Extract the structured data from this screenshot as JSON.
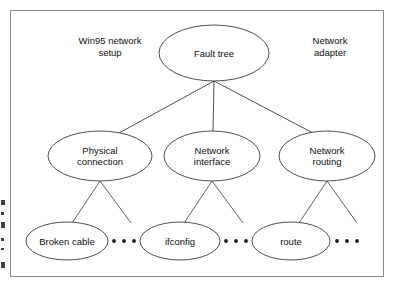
{
  "figure": {
    "kind": "fault-tree-diagram",
    "background_color": "#ffffff",
    "frame_color": "#8a8a8a",
    "stroke_color": "#3a3a3a",
    "text_color": "#101010"
  },
  "annotations": [
    {
      "id": "left-annotation",
      "text": "Win95 network\nsetup",
      "x": 110,
      "y": 46
    },
    {
      "id": "right-annotation",
      "text": "Network\nadapter",
      "x": 330,
      "y": 46
    }
  ],
  "nodes": [
    {
      "id": "fault-tree",
      "label": "Fault tree",
      "level": 0,
      "cx": 214,
      "cy": 53,
      "rx": 55,
      "ry": 28
    },
    {
      "id": "physical-connection",
      "label": "Physical\nconnection",
      "level": 1,
      "cx": 100,
      "cy": 156,
      "rx": 52,
      "ry": 25
    },
    {
      "id": "network-interface",
      "label": "Network\ninterface",
      "level": 1,
      "cx": 212,
      "cy": 156,
      "rx": 48,
      "ry": 25
    },
    {
      "id": "network-routing",
      "label": "Network\nrouting",
      "level": 1,
      "cx": 327,
      "cy": 156,
      "rx": 48,
      "ry": 25
    },
    {
      "id": "broken-cable",
      "label": "Broken cable",
      "level": 2,
      "cx": 67,
      "cy": 241,
      "rx": 41,
      "ry": 19
    },
    {
      "id": "ifconfig",
      "label": "ifconfig",
      "level": 2,
      "cx": 180,
      "cy": 241,
      "rx": 40,
      "ry": 19
    },
    {
      "id": "route",
      "label": "route",
      "level": 2,
      "cx": 291,
      "cy": 241,
      "rx": 39,
      "ry": 19
    }
  ],
  "edges": [
    {
      "id": "edge-root-physical",
      "from": "fault-tree",
      "to": "physical-connection",
      "x1": 214,
      "y1": 81,
      "x2": 119,
      "y2": 133
    },
    {
      "id": "edge-root-interface",
      "from": "fault-tree",
      "to": "network-interface",
      "x1": 214,
      "y1": 81,
      "x2": 213,
      "y2": 131
    },
    {
      "id": "edge-root-routing",
      "from": "fault-tree",
      "to": "network-routing",
      "x1": 214,
      "y1": 81,
      "x2": 313,
      "y2": 133
    },
    {
      "id": "edge-physical-broken",
      "from": "physical-connection",
      "to": "broken-cable",
      "x1": 100,
      "y1": 181,
      "x2": 72,
      "y2": 223
    },
    {
      "id": "edge-physical-more",
      "from": "physical-connection",
      "to": "more-1",
      "x1": 100,
      "y1": 181,
      "x2": 131,
      "y2": 223
    },
    {
      "id": "edge-interface-ifconfig",
      "from": "network-interface",
      "to": "ifconfig",
      "x1": 212,
      "y1": 181,
      "x2": 184,
      "y2": 223
    },
    {
      "id": "edge-interface-more",
      "from": "network-interface",
      "to": "more-2",
      "x1": 212,
      "y1": 181,
      "x2": 243,
      "y2": 223
    },
    {
      "id": "edge-routing-route",
      "from": "network-routing",
      "to": "route",
      "x1": 327,
      "y1": 181,
      "x2": 299,
      "y2": 223
    },
    {
      "id": "edge-routing-more",
      "from": "network-routing",
      "to": "more-3",
      "x1": 327,
      "y1": 181,
      "x2": 357,
      "y2": 223
    }
  ],
  "ellipses_dots": [
    {
      "id": "ellipsis-after-broken-cable",
      "count": 3,
      "cx": 124,
      "cy": 241
    },
    {
      "id": "ellipsis-after-ifconfig",
      "count": 3,
      "cx": 236,
      "cy": 241
    },
    {
      "id": "ellipsis-after-route",
      "count": 3,
      "cx": 347,
      "cy": 241
    }
  ],
  "margin_marks": [
    {
      "id": "margin-mark-1",
      "x": 1,
      "y": 200,
      "w": 4,
      "h": 5
    },
    {
      "id": "margin-mark-2",
      "x": 1,
      "y": 212,
      "w": 3,
      "h": 3
    },
    {
      "id": "margin-mark-3",
      "x": 1,
      "y": 222,
      "w": 4,
      "h": 6
    },
    {
      "id": "margin-mark-4",
      "x": 1,
      "y": 238,
      "w": 3,
      "h": 3
    },
    {
      "id": "margin-mark-5",
      "x": 1,
      "y": 248,
      "w": 3,
      "h": 2
    },
    {
      "id": "margin-mark-6",
      "x": 1,
      "y": 262,
      "w": 4,
      "h": 6
    }
  ]
}
